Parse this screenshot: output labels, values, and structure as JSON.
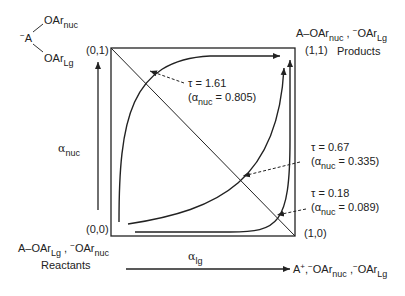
{
  "reagent_structure": {
    "center": "A",
    "charge": "−",
    "top_group": "OAr",
    "top_sub": "nuc",
    "bottom_group": "OAr",
    "bottom_sub": "Lg"
  },
  "corners": {
    "top_left": "(0,1)",
    "top_right": "(1,1)",
    "bottom_left": "(0,0)",
    "bottom_right": "(1,0)"
  },
  "products": {
    "formula_part1": "A–OAr",
    "formula_sub1": "nuc",
    "separator": " ,",
    "charge": "−",
    "formula_part2": "OAr",
    "formula_sub2": "Lg",
    "label": "Products"
  },
  "reactants": {
    "formula_part1": "A–OAr",
    "formula_sub1": "Lg",
    "separator": " ,",
    "charge": "−",
    "formula_part2": "OAr",
    "formula_sub2": "nuc",
    "label": "Reactants"
  },
  "intermediate": {
    "formula": "A",
    "plus": "+",
    "sep1": ",",
    "charge1": "−",
    "group1": "OAr",
    "sub1": "nuc",
    "sep2": " ,",
    "charge2": "−",
    "group2": "OAr",
    "sub2": "Lg"
  },
  "axes": {
    "y_symbol": "α",
    "y_sub": "nuc",
    "x_symbol": "α",
    "x_sub": "lg"
  },
  "annotations": [
    {
      "tau": "τ = 1.61",
      "alpha_prefix": "(α",
      "alpha_sub": "nuc",
      "alpha_value": " = 0.805)"
    },
    {
      "tau": "τ = 0.67",
      "alpha_prefix": "(α",
      "alpha_sub": "nuc",
      "alpha_value": " = 0.335)"
    },
    {
      "tau": "τ = 0.18",
      "alpha_prefix": "(α",
      "alpha_sub": "nuc",
      "alpha_value": " = 0.089)"
    }
  ],
  "colors": {
    "line": "#222222",
    "background": "#ffffff"
  }
}
